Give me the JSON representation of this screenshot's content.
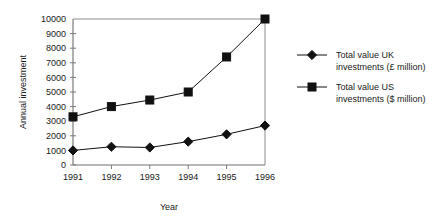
{
  "chart_data": {
    "type": "line",
    "title": "",
    "xlabel": "Year",
    "ylabel": "Annual investment",
    "categories": [
      "1991",
      "1992",
      "1993",
      "1994",
      "1995",
      "1996"
    ],
    "x": [
      1991,
      1992,
      1993,
      1994,
      1995,
      1996
    ],
    "xlim": [
      1991,
      1996
    ],
    "ylim": [
      0,
      10000
    ],
    "y_ticks": [
      "0",
      "1000",
      "2000",
      "3000",
      "4000",
      "5000",
      "6000",
      "7000",
      "8000",
      "9000",
      "10000"
    ],
    "y_tick_values": [
      0,
      1000,
      2000,
      3000,
      4000,
      5000,
      6000,
      7000,
      8000,
      9000,
      10000
    ],
    "grid": false,
    "legend_position": "right",
    "series": [
      {
        "name": "Total value UK investments (£ million)",
        "name_line1": "Total value UK",
        "name_line2": "investments (£ million)",
        "marker": "diamond",
        "color": "#111111",
        "values": [
          1000,
          1250,
          1200,
          1600,
          2100,
          2700
        ]
      },
      {
        "name": "Total value US investments ($ million)",
        "name_line1": "Total value US",
        "name_line2": "investments ($ million)",
        "marker": "square",
        "color": "#111111",
        "values": [
          3300,
          4000,
          4450,
          5000,
          7400,
          10000
        ]
      }
    ]
  },
  "colors": {
    "axis": "#7a7a7a",
    "frame": "#8c8c8c",
    "series": "#111111",
    "text": "#1a1a1a",
    "background": "#ffffff"
  }
}
